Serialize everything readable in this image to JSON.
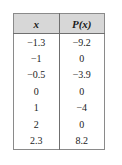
{
  "table": {
    "headers": [
      "x",
      "P(x)"
    ],
    "header_x": "x",
    "header_px": "P(x)",
    "rows": [
      {
        "x": "−1.3",
        "px": "−9.2"
      },
      {
        "x": "−1",
        "px": "0"
      },
      {
        "x": "−0.5",
        "px": "−3.9"
      },
      {
        "x": "0",
        "px": "0"
      },
      {
        "x": "1",
        "px": "−4"
      },
      {
        "x": "2",
        "px": "0"
      },
      {
        "x": "2.3",
        "px": "8.2"
      }
    ],
    "colors": {
      "header_background": "#d7d7d7",
      "border": "#8a8a8a",
      "inner_rule": "#6f6f6f",
      "text": "#1b1b1b",
      "background": "#ffffff"
    }
  }
}
